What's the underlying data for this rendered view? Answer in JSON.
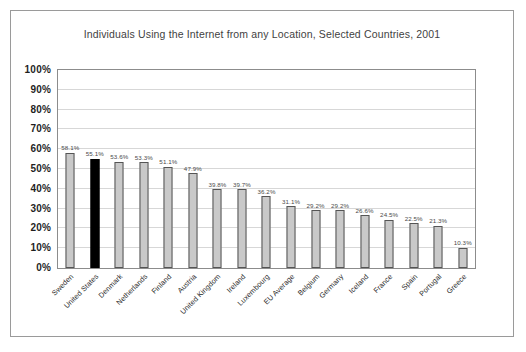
{
  "chart_data": {
    "type": "bar",
    "title": "Individuals Using the Internet from any Location, Selected Countries, 2001",
    "xlabel": "",
    "ylabel": "",
    "ylim": [
      0,
      100
    ],
    "grid": true,
    "legend": "none",
    "categories": [
      "Sweden",
      "United States",
      "Denmark",
      "Netherlands",
      "Finland",
      "Austria",
      "United Kingdom",
      "Ireland",
      "Luxembourg",
      "EU Average",
      "Belgium",
      "Germany",
      "Iceland",
      "France",
      "Spain",
      "Portugal",
      "Greece"
    ],
    "values": [
      58.1,
      55.1,
      53.6,
      53.3,
      51.1,
      47.9,
      39.8,
      39.7,
      36.2,
      31.1,
      29.2,
      29.2,
      26.6,
      24.5,
      22.5,
      21.3,
      10.3
    ],
    "value_labels": [
      "58.1%",
      "55.1%",
      "53.6%",
      "53.3%",
      "51.1%",
      "47.9%",
      "39.8%",
      "39.7%",
      "36.2%",
      "31.1%",
      "29.2%",
      "29.2%",
      "26.6%",
      "24.5%",
      "22.5%",
      "21.3%",
      "10.3%"
    ],
    "highlight_index": 1,
    "y_ticks": [
      "0%",
      "10%",
      "20%",
      "30%",
      "40%",
      "50%",
      "60%",
      "70%",
      "80%",
      "90%",
      "100%"
    ],
    "y_tick_values": [
      0,
      10,
      20,
      30,
      40,
      50,
      60,
      70,
      80,
      90,
      100
    ],
    "colors": {
      "bar_fill": "#c9c9c9",
      "bar_border": "#555555",
      "highlight_fill": "#000000",
      "gridline": "#d7d7d7",
      "plot_border": "#8c8c8c",
      "frame_border": "#9a9a9a",
      "title_text": "#3f3f3f",
      "axis_text": "#1f1f1f",
      "label_text": "#4a4a4a",
      "background": "#ffffff"
    }
  },
  "footnote": {
    "text": ""
  }
}
